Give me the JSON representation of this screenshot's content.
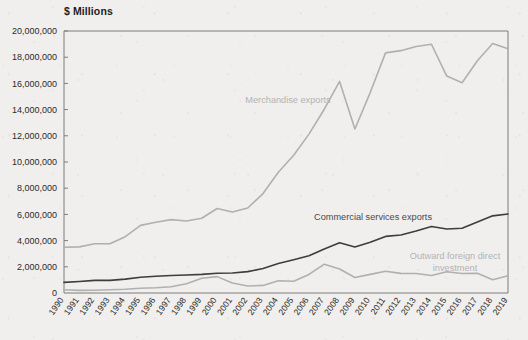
{
  "figure": {
    "axis_unit_title": "$ Millions",
    "background_color": "#f0efed"
  },
  "annotations": {
    "merchandise": {
      "text": "Merchandise exports",
      "color": "#b3b3b3",
      "x": 288,
      "y": 103
    },
    "commercial": {
      "text": "Commercial services exports",
      "color": "#4a4a4a",
      "x": 432,
      "y": 220
    },
    "fdi_line1": {
      "text": "Outward foreign direct",
      "color": "#b3b3b3",
      "x": 455,
      "y": 259
    },
    "fdi_line2": {
      "text": "investment",
      "color": "#b3b3b3",
      "x": 455,
      "y": 271
    }
  },
  "axes": {
    "y_ticks": [
      "0",
      "2,000,000",
      "4,000,000",
      "6,000,000",
      "8,000,000",
      "10,000,000",
      "12,000,000",
      "14,000,000",
      "16,000,000",
      "18,000,000",
      "20,000,000"
    ],
    "x_ticks": [
      "1990",
      "1991",
      "1992",
      "1993",
      "1994",
      "1995",
      "1996",
      "1997",
      "1998",
      "1999",
      "2000",
      "2001",
      "2002",
      "2003",
      "2004",
      "2005",
      "2006",
      "2007",
      "2008",
      "2009",
      "2010",
      "2011",
      "2012",
      "2013",
      "2014",
      "2015",
      "2016",
      "2017",
      "2018",
      "2019"
    ]
  },
  "chart_data": {
    "type": "line",
    "title": "",
    "subtitle": "",
    "xlabel": "",
    "ylabel": "$ Millions",
    "ylim": [
      0,
      20000000
    ],
    "ytick_step": 2000000,
    "grid": false,
    "legend": "inline-annotations",
    "x": [
      1990,
      1991,
      1992,
      1993,
      1994,
      1995,
      1996,
      1997,
      1998,
      1999,
      2000,
      2001,
      2002,
      2003,
      2004,
      2005,
      2006,
      2007,
      2008,
      2009,
      2010,
      2011,
      2012,
      2013,
      2014,
      2015,
      2016,
      2017,
      2018,
      2019
    ],
    "series": [
      {
        "name": "Merchandise exports",
        "color": "#b0b0b0",
        "values": [
          3490000,
          3520000,
          3760000,
          3760000,
          4300000,
          5160000,
          5400000,
          5600000,
          5500000,
          5710000,
          6450000,
          6180000,
          6490000,
          7590000,
          9220000,
          10510000,
          12130000,
          14030000,
          16150000,
          12520000,
          15300000,
          18330000,
          18500000,
          18820000,
          18990000,
          16560000,
          16050000,
          17730000,
          19050000,
          18640000
        ]
      },
      {
        "name": "Commercial services exports",
        "color": "#3d3d3d",
        "values": [
          810000,
          880000,
          960000,
          960000,
          1060000,
          1200000,
          1280000,
          1340000,
          1370000,
          1420000,
          1510000,
          1530000,
          1630000,
          1870000,
          2250000,
          2540000,
          2840000,
          3360000,
          3830000,
          3510000,
          3880000,
          4320000,
          4430000,
          4740000,
          5080000,
          4880000,
          4940000,
          5420000,
          5890000,
          6030000
        ]
      },
      {
        "name": "Outward foreign direct investment",
        "color": "#b0b0b0",
        "values": [
          250000,
          200000,
          210000,
          250000,
          290000,
          360000,
          400000,
          480000,
          700000,
          1130000,
          1250000,
          760000,
          530000,
          580000,
          930000,
          900000,
          1420000,
          2200000,
          1830000,
          1180000,
          1420000,
          1660000,
          1500000,
          1490000,
          1330000,
          1620000,
          1490000,
          1510000,
          1010000,
          1310000
        ]
      }
    ]
  }
}
